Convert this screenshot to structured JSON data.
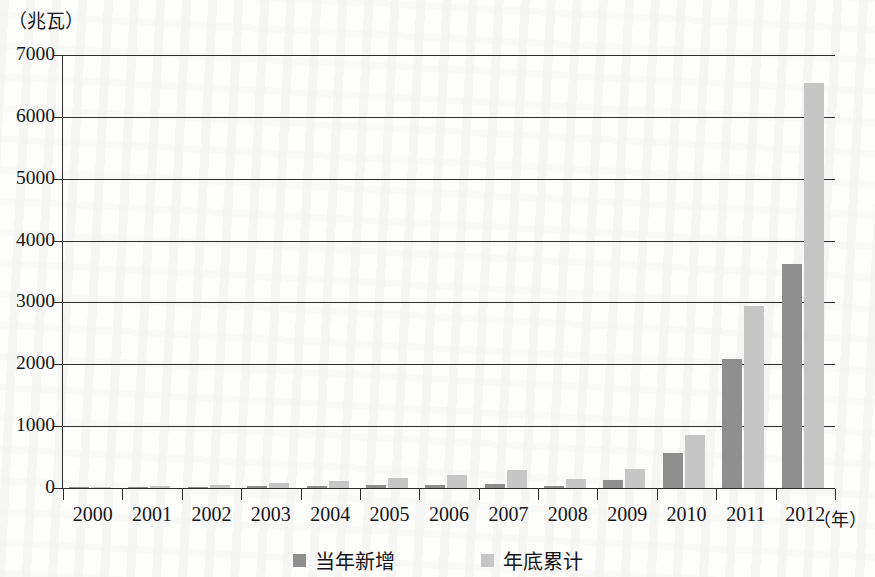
{
  "axis": {
    "y_unit_label": "（兆瓦）",
    "x_unit_label": "（年）",
    "y_ticks": [
      "7000",
      "6000",
      "5000",
      "4000",
      "3000",
      "2000",
      "1000",
      "0"
    ]
  },
  "legend": {
    "items": [
      {
        "label": "当年新增",
        "color": "#8e8e8e",
        "icon": "square-swatch-icon"
      },
      {
        "label": "年底累计",
        "color": "#c6c6c6",
        "icon": "square-swatch-icon"
      }
    ]
  },
  "colors": {
    "series_new": "#8e8e8e",
    "series_cumulative": "#c6c6c6",
    "axis": "#2b2b2b",
    "text": "#15151a",
    "background": "#fdfdfc"
  },
  "chart_data": {
    "type": "bar",
    "title": "",
    "xlabel": "（年）",
    "ylabel": "（兆瓦）",
    "ylim": [
      0,
      7000
    ],
    "ytick_step": 1000,
    "grid": true,
    "legend_position": "bottom",
    "categories": [
      "2000",
      "2001",
      "2002",
      "2003",
      "2004",
      "2005",
      "2006",
      "2007",
      "2008",
      "2009",
      "2010",
      "2011",
      "2012"
    ],
    "series": [
      {
        "name": "当年新增",
        "color": "#8e8e8e",
        "values": [
          10,
          15,
          20,
          25,
          35,
          45,
          55,
          70,
          30,
          130,
          570,
          2090,
          3620
        ]
      },
      {
        "name": "年底累计",
        "color": "#c6c6c6",
        "values": [
          20,
          35,
          55,
          80,
          115,
          160,
          215,
          285,
          145,
          300,
          860,
          2940,
          6540
        ]
      }
    ]
  }
}
